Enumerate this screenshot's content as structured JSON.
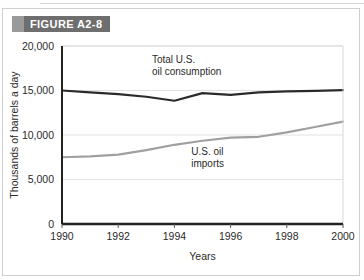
{
  "figure": {
    "banner_label": "FIGURE A2-8"
  },
  "chart_data": {
    "type": "line",
    "title": "",
    "xlabel": "Years",
    "ylabel": "Thousands of barrels a day",
    "xlim": [
      1990,
      2000
    ],
    "ylim": [
      0,
      20000
    ],
    "xticks": [
      "1990",
      "1992",
      "1994",
      "1996",
      "1998",
      "2000"
    ],
    "xtick_values": [
      1990,
      1992,
      1994,
      1996,
      1998,
      2000
    ],
    "yticks": [
      "0",
      "5,000",
      "10,000",
      "15,000",
      "20,000"
    ],
    "ytick_values": [
      0,
      5000,
      10000,
      15000,
      20000
    ],
    "grid": true,
    "legend": "annotations",
    "x": [
      1990,
      1991,
      1992,
      1993,
      1994,
      1995,
      1996,
      1997,
      1998,
      1999,
      2000
    ],
    "series": [
      {
        "name": "Total U.S. oil consumption",
        "color": "#2b2b2b",
        "width": 2.2,
        "values": [
          15000,
          14800,
          14600,
          14300,
          13850,
          14700,
          14500,
          14800,
          14900,
          14950,
          15050
        ],
        "annotation": {
          "line1": "Total U.S.",
          "line2": "oil consumption",
          "x": 1993.2,
          "y": 18100
        }
      },
      {
        "name": "U.S. oil imports",
        "color": "#a0a0a0",
        "width": 2.2,
        "values": [
          7500,
          7600,
          7800,
          8300,
          8900,
          9350,
          9700,
          9800,
          10300,
          10900,
          11500
        ],
        "annotation": {
          "line1": "U.S. oil",
          "line2": "imports",
          "x": 1994.6,
          "y": 7700
        }
      }
    ]
  }
}
